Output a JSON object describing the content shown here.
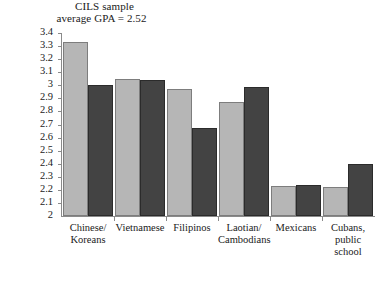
{
  "chart_data": {
    "type": "bar",
    "title": "CILS sample average GPA = 2.52",
    "title_lines": [
      "CILS sample",
      "average GPA = 2.52"
    ],
    "xlabel": "",
    "ylabel": "",
    "ylim": [
      2,
      3.4
    ],
    "ytick_step": 0.1,
    "yticks": [
      "3.4",
      "3.3",
      "3.2",
      "3.1",
      "3",
      "2.9",
      "2.8",
      "2.7",
      "2.6",
      "2.5",
      "2.4",
      "2.3",
      "2.2",
      "2.1",
      "2"
    ],
    "ytick_values": [
      3.4,
      3.3,
      3.2,
      3.1,
      3.0,
      2.9,
      2.8,
      2.7,
      2.6,
      2.5,
      2.4,
      2.3,
      2.2,
      2.1,
      2.0
    ],
    "grid": false,
    "legend_position": "none",
    "categories": [
      "Chinese/\nKoreans",
      "Vietnamese",
      "Filipinos",
      "Laotian/\nCambodians",
      "Mexicans",
      "Cubans,\npublic\nschool"
    ],
    "series": [
      {
        "name": "series-1",
        "color": "#b6b6b6",
        "values": [
          3.33,
          3.05,
          2.97,
          2.87,
          2.23,
          2.22
        ]
      },
      {
        "name": "series-2",
        "color": "#434343",
        "values": [
          3.0,
          3.04,
          2.67,
          2.99,
          2.24,
          2.4
        ]
      }
    ]
  }
}
